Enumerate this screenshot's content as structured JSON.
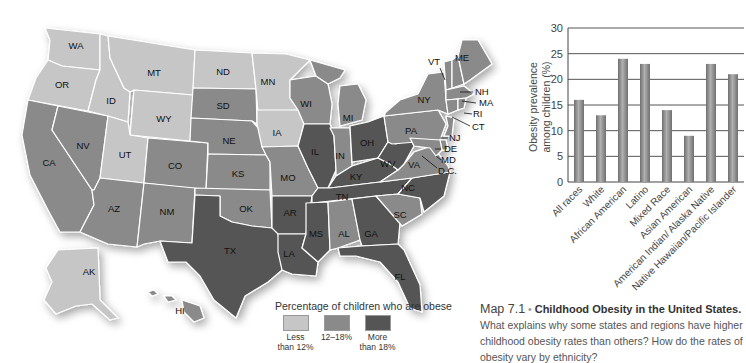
{
  "map": {
    "colors": {
      "low": "#c6c6c6",
      "mid": "#8a8a8a",
      "high": "#555555",
      "background": "#ffffff"
    },
    "states": [
      {
        "abbr": "WA",
        "level": "low"
      },
      {
        "abbr": "OR",
        "level": "low"
      },
      {
        "abbr": "CA",
        "level": "mid"
      },
      {
        "abbr": "NV",
        "level": "mid"
      },
      {
        "abbr": "ID",
        "level": "low"
      },
      {
        "abbr": "MT",
        "level": "low"
      },
      {
        "abbr": "WY",
        "level": "low"
      },
      {
        "abbr": "UT",
        "level": "low"
      },
      {
        "abbr": "AZ",
        "level": "mid"
      },
      {
        "abbr": "CO",
        "level": "mid"
      },
      {
        "abbr": "NM",
        "level": "mid"
      },
      {
        "abbr": "ND",
        "level": "low"
      },
      {
        "abbr": "SD",
        "level": "mid"
      },
      {
        "abbr": "NE",
        "level": "mid"
      },
      {
        "abbr": "KS",
        "level": "mid"
      },
      {
        "abbr": "OK",
        "level": "mid"
      },
      {
        "abbr": "TX",
        "level": "high"
      },
      {
        "abbr": "MN",
        "level": "low"
      },
      {
        "abbr": "IA",
        "level": "low"
      },
      {
        "abbr": "MO",
        "level": "mid"
      },
      {
        "abbr": "AR",
        "level": "high"
      },
      {
        "abbr": "LA",
        "level": "high"
      },
      {
        "abbr": "WI",
        "level": "mid"
      },
      {
        "abbr": "IL",
        "level": "high"
      },
      {
        "abbr": "MI",
        "level": "mid"
      },
      {
        "abbr": "IN",
        "level": "mid"
      },
      {
        "abbr": "OH",
        "level": "high"
      },
      {
        "abbr": "KY",
        "level": "high"
      },
      {
        "abbr": "TN",
        "level": "high"
      },
      {
        "abbr": "MS",
        "level": "high"
      },
      {
        "abbr": "AL",
        "level": "mid"
      },
      {
        "abbr": "GA",
        "level": "high"
      },
      {
        "abbr": "FL",
        "level": "high"
      },
      {
        "abbr": "SC",
        "level": "mid"
      },
      {
        "abbr": "NC",
        "level": "high"
      },
      {
        "abbr": "VA",
        "level": "mid"
      },
      {
        "abbr": "WV",
        "level": "high"
      },
      {
        "abbr": "PA",
        "level": "mid"
      },
      {
        "abbr": "NY",
        "level": "mid"
      },
      {
        "abbr": "VT",
        "level": "mid"
      },
      {
        "abbr": "NH",
        "level": "mid"
      },
      {
        "abbr": "ME",
        "level": "mid"
      },
      {
        "abbr": "MA",
        "level": "mid"
      },
      {
        "abbr": "RI",
        "level": "mid"
      },
      {
        "abbr": "CT",
        "level": "mid"
      },
      {
        "abbr": "NJ",
        "level": "mid"
      },
      {
        "abbr": "DE",
        "level": "mid"
      },
      {
        "abbr": "MD",
        "level": "mid"
      },
      {
        "abbr": "D.C.",
        "level": "mid"
      },
      {
        "abbr": "AK",
        "level": "low"
      },
      {
        "abbr": "HI",
        "level": "mid"
      }
    ],
    "labels": {
      "WA": "WA",
      "OR": "OR",
      "CA": "CA",
      "NV": "NV",
      "ID": "ID",
      "MT": "MT",
      "WY": "WY",
      "UT": "UT",
      "AZ": "AZ",
      "CO": "CO",
      "NM": "NM",
      "ND": "ND",
      "SD": "SD",
      "NE": "NE",
      "KS": "KS",
      "OK": "OK",
      "TX": "TX",
      "MN": "MN",
      "IA": "IA",
      "MO": "MO",
      "AR": "AR",
      "LA": "LA",
      "WI": "WI",
      "IL": "IL",
      "MI": "MI",
      "IN": "IN",
      "OH": "OH",
      "KY": "KY",
      "TN": "TN",
      "MS": "MS",
      "AL": "AL",
      "GA": "GA",
      "FL": "FL",
      "SC": "SC",
      "NC": "NC",
      "VA": "VA",
      "WV": "WV",
      "PA": "PA",
      "NY": "NY",
      "VT": "VT",
      "NH": "NH",
      "ME": "ME",
      "MA": "MA",
      "RI": "RI",
      "CT": "CT",
      "NJ": "NJ",
      "DE": "DE",
      "MD": "MD",
      "DC": "D.C.",
      "AK": "AK",
      "HI": "HI"
    },
    "legend": {
      "title": "Percentage of children who are obese",
      "items": [
        {
          "label_line1": "Less",
          "label_line2": "than 12%",
          "color": "#c6c6c6"
        },
        {
          "label_line1": "12–18%",
          "label_line2": "",
          "color": "#8a8a8a"
        },
        {
          "label_line1": "More",
          "label_line2": "than 18%",
          "color": "#555555"
        }
      ]
    }
  },
  "caption": {
    "number": "Map 7.1",
    "bullet": "•",
    "title": "Childhood Obesity in the United States.",
    "text": "What explains why some states and regions have higher childhood obesity rates than others? How do the rates of obesity vary by ethnicity?"
  },
  "chart_data": {
    "type": "bar",
    "title": "",
    "xlabel": "",
    "ylabel": "Obesity prevalence among children (%)",
    "ylim": [
      0,
      30
    ],
    "yticks": [
      0,
      5,
      10,
      15,
      20,
      25,
      30
    ],
    "grid": true,
    "categories": [
      "All races",
      "White",
      "African American",
      "Latino",
      "Mixed Race",
      "Asian American",
      "American Indian/ Alaska Native",
      "Native Hawaiian/Pacific Islander"
    ],
    "values": [
      16,
      13,
      24,
      23,
      14,
      9,
      23,
      21
    ],
    "bar_color": "#8c8c8c"
  }
}
